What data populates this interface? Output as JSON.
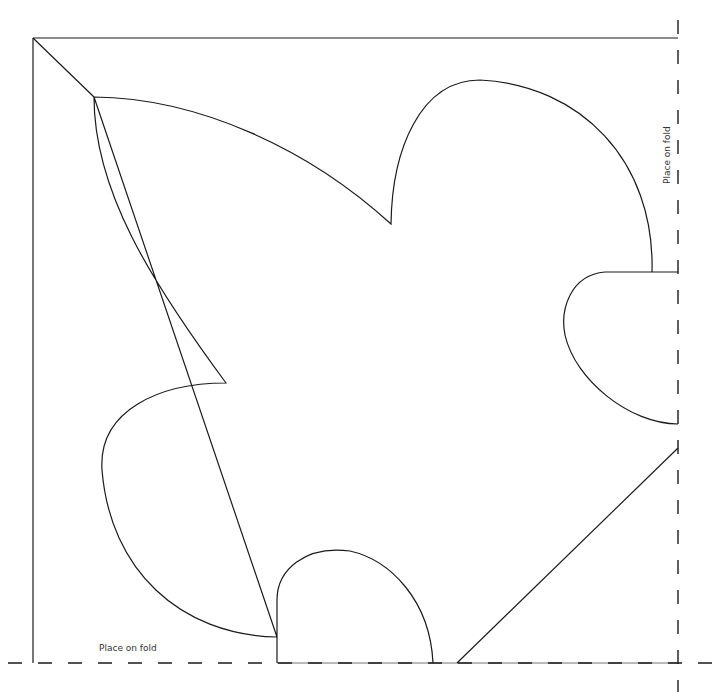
{
  "document": {
    "type": "sewing/craft template",
    "header_text_truncated": "",
    "labels": {
      "bottom_fold": "Place on fold",
      "right_fold": "Place on fold"
    }
  },
  "geometry": {
    "stroke_color": "#1a1a1a",
    "frame": {
      "left": 33,
      "top": 38,
      "right": 678,
      "bottom": 663
    },
    "fold_lines": {
      "right": {
        "x": 678,
        "y_start": 20,
        "y_end": 692,
        "dashed": true
      },
      "bottom": {
        "y": 663,
        "x_start": 8,
        "x_end": 718,
        "dashed": true
      }
    }
  }
}
